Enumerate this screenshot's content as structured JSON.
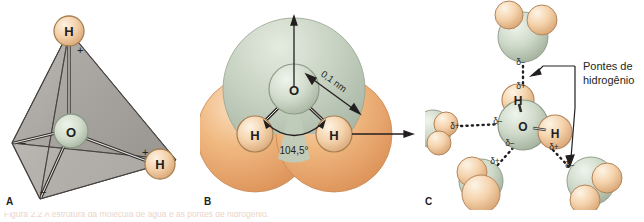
{
  "figure": {
    "title": "Estrutura da molécula de água",
    "caption_partial": "Figura 2.2  A estrutura da molécula de água e as pontes de hidrogênio.",
    "background_color": "#ffffff"
  },
  "colors": {
    "oxygen_fill": "#cdd8c8",
    "oxygen_fill_light": "#e6ece2",
    "oxygen_edge": "#8d9a88",
    "hydrogen_fill": "#f5d3ad",
    "hydrogen_fill_light": "#fbeeda",
    "hydrogen_edge": "#b98a5c",
    "shell_orange": "#e8a56a",
    "shell_orange_light": "#f6cfa4",
    "shell_green": "#c5d0c0",
    "shell_green_light": "#dde5d9",
    "tetrahedron_fill": "#b9b6b2",
    "tetrahedron_edge": "#4d4a47",
    "bond_stroke": "#3a3734",
    "label_text": "#231f20",
    "caption_text": "#d8b49a"
  },
  "panels": [
    {
      "id": "A",
      "label": "A",
      "description": "Modelo tetraédrico da molécula de água com orbitais",
      "atoms": [
        {
          "symbol": "O",
          "name": "oxygen-atom",
          "x": 71,
          "y": 131,
          "r": 17
        },
        {
          "symbol": "H",
          "name": "hydrogen-atom-top",
          "x": 69,
          "y": 31,
          "r": 15
        },
        {
          "symbol": "H",
          "name": "hydrogen-atom-right",
          "x": 160,
          "y": 164,
          "r": 15
        }
      ],
      "charges": [
        {
          "sign": "+",
          "name": "charge-plus-top",
          "x": 77,
          "y": 50
        },
        {
          "sign": "+",
          "name": "charge-plus-right",
          "x": 144,
          "y": 153
        },
        {
          "sign": "−",
          "name": "charge-minus-left",
          "x": 23,
          "y": 143
        },
        {
          "sign": "−",
          "name": "charge-minus-bottom",
          "x": 42,
          "y": 192
        }
      ]
    },
    {
      "id": "B",
      "label": "B",
      "description": "Modelo de preenchimento espacial com ângulo de ligação e distância",
      "atoms": [
        {
          "symbol": "O",
          "name": "oxygen-atom",
          "x": 94,
          "y": 89,
          "r": 25
        },
        {
          "symbol": "H",
          "name": "hydrogen-atom-left",
          "x": 55,
          "y": 134,
          "r": 18
        },
        {
          "symbol": "H",
          "name": "hydrogen-atom-right",
          "x": 134,
          "y": 134,
          "r": 18
        }
      ],
      "annotations": [
        {
          "name": "bond-angle-label",
          "text": "104,5°",
          "value": 104.5,
          "unit": "degrees"
        },
        {
          "name": "bond-length-label",
          "text": "0,1 nm",
          "value": 0.1,
          "unit": "nm"
        }
      ]
    },
    {
      "id": "C",
      "label": "C",
      "description": "Rede de pontes de hidrogênio entre moléculas de água",
      "callout": {
        "name": "hydrogen-bond-callout",
        "line1": "Pontes de",
        "line2": "hidrogênio"
      },
      "central_atoms": [
        {
          "symbol": "O",
          "name": "oxygen-atom-center",
          "x": 98,
          "y": 125
        },
        {
          "symbol": "H",
          "name": "hydrogen-atom-upper",
          "x": 93,
          "y": 100
        },
        {
          "symbol": "H",
          "name": "hydrogen-atom-lower-right",
          "x": 130,
          "y": 132
        }
      ],
      "charge_labels": [
        {
          "name": "delta-minus-top",
          "text": "δ−",
          "x": 96,
          "y": 62
        },
        {
          "name": "delta-plus-top",
          "text": "δ+",
          "x": 96,
          "y": 85
        },
        {
          "name": "delta-plus-left",
          "text": "δ+",
          "x": 32,
          "y": 126
        },
        {
          "name": "delta-minus-left",
          "text": "δ−",
          "x": 72,
          "y": 122
        },
        {
          "name": "delta-minus-bottom",
          "text": "δ−",
          "x": 84,
          "y": 142
        },
        {
          "name": "delta-plus-bottom",
          "text": "δ+",
          "x": 73,
          "y": 158
        },
        {
          "name": "delta-plus-right",
          "text": "δ+",
          "x": 128,
          "y": 146
        },
        {
          "name": "delta-minus-right",
          "text": "δ−",
          "x": 141,
          "y": 163
        }
      ]
    }
  ]
}
